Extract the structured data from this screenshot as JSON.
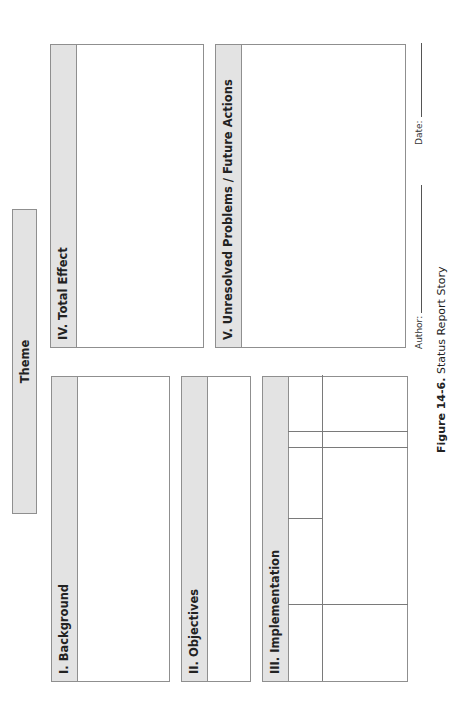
{
  "theme": {
    "label": "Theme"
  },
  "sections": {
    "background": {
      "label": "I. Background"
    },
    "objectives": {
      "label": "II. Objectives"
    },
    "implementation": {
      "label": "III. Implementation"
    },
    "total_effect": {
      "label": "IV. Total Effect"
    },
    "unresolved": {
      "label": "V. Unresolved Problems / Future Actions"
    }
  },
  "signature": {
    "author_label": "Author:",
    "date_label": "Date:"
  },
  "caption": {
    "figure_number": "Figure 14-6.",
    "title": "Status Report Story"
  },
  "colors": {
    "header_fill": "#e3e3e3",
    "border": "#8f8f8f",
    "text": "#222222"
  }
}
